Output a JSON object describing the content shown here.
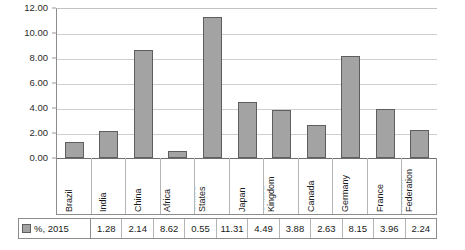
{
  "chart_data": {
    "type": "bar",
    "title": "",
    "subtitle": "",
    "xlabel": "",
    "ylabel": "",
    "ylim": [
      0,
      12
    ],
    "ytick_step": 2,
    "grid": true,
    "legend_position": "bottom-left-table",
    "categories": [
      "Brazil",
      "India",
      "China",
      "South Africa",
      "United States",
      "Japan",
      "United Kingdom",
      "Canada",
      "Germany",
      "France",
      "Russian Federation"
    ],
    "category_lines": [
      [
        "Brazil"
      ],
      [
        "India"
      ],
      [
        "China"
      ],
      [
        "South",
        "Africa"
      ],
      [
        "United",
        "States"
      ],
      [
        "Japan"
      ],
      [
        "United",
        "Kingdom"
      ],
      [
        "Canada"
      ],
      [
        "Germany"
      ],
      [
        "France"
      ],
      [
        "Russian",
        "Federation"
      ]
    ],
    "series": [
      {
        "name": "%, 2015",
        "values": [
          1.28,
          2.14,
          8.62,
          0.55,
          11.31,
          4.49,
          3.88,
          2.63,
          8.15,
          3.96,
          2.24
        ]
      }
    ],
    "ytick_labels": [
      "12.00",
      "10.00",
      "8.00",
      "6.00",
      "4.00",
      "2.00",
      "0.00"
    ],
    "value_labels": [
      "1.28",
      "2.14",
      "8.62",
      "0.55",
      "11.31",
      "4.49",
      "3.88",
      "2.63",
      "8.15",
      "3.96",
      "2.24"
    ]
  },
  "legend": {
    "series_label": "%, 2015",
    "swatch_name": "bar-color-swatch"
  },
  "colors": {
    "bar_fill": "#a3a3a3",
    "bar_stroke": "#5e5e5e",
    "gridline": "#cfcfcf",
    "axis": "#8c8c8c",
    "background": "#ffffff",
    "text": "#1a1a1a"
  }
}
